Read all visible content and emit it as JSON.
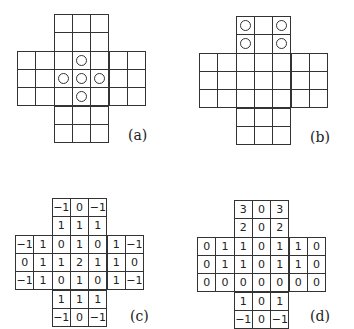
{
  "figure": {
    "panels": [
      {
        "id": "a",
        "label": "(a)",
        "type": "peg-board",
        "pegs": [
          [
            2,
            3
          ],
          [
            3,
            2
          ],
          [
            3,
            3
          ],
          [
            3,
            4
          ],
          [
            4,
            3
          ]
        ]
      },
      {
        "id": "b",
        "label": "(b)",
        "type": "peg-board",
        "pegs": [
          [
            0,
            2
          ],
          [
            0,
            4
          ],
          [
            1,
            2
          ],
          [
            1,
            4
          ]
        ]
      },
      {
        "id": "c",
        "label": "(c)",
        "type": "number-board",
        "rows": [
          [
            null,
            null,
            "-1",
            "0",
            "-1",
            null,
            null
          ],
          [
            null,
            null,
            "1",
            "1",
            "1",
            null,
            null
          ],
          [
            "-1",
            "1",
            "0",
            "1",
            "0",
            "1",
            "-1"
          ],
          [
            "0",
            "1",
            "1",
            "2",
            "1",
            "1",
            "0"
          ],
          [
            "-1",
            "1",
            "0",
            "1",
            "0",
            "1",
            "-1"
          ],
          [
            null,
            null,
            "1",
            "1",
            "1",
            null,
            null
          ],
          [
            null,
            null,
            "-1",
            "0",
            "-1",
            null,
            null
          ]
        ]
      },
      {
        "id": "d",
        "label": "(d)",
        "type": "number-board",
        "rows": [
          [
            null,
            null,
            "3",
            "0",
            "3",
            null,
            null
          ],
          [
            null,
            null,
            "2",
            "0",
            "2",
            null,
            null
          ],
          [
            "0",
            "1",
            "1",
            "0",
            "1",
            "1",
            "0"
          ],
          [
            "0",
            "1",
            "1",
            "0",
            "1",
            "1",
            "0"
          ],
          [
            "0",
            "0",
            "0",
            "0",
            "0",
            "0",
            "0"
          ],
          [
            null,
            null,
            "1",
            "0",
            "1",
            null,
            null
          ],
          [
            null,
            null,
            "-1",
            "0",
            "-1",
            null,
            null
          ]
        ]
      }
    ]
  },
  "layout": {
    "boards": [
      {
        "x": 17,
        "y": 14,
        "cell": 18.3
      },
      {
        "x": 199,
        "y": 16,
        "cell": 18.3
      },
      {
        "x": 15,
        "y": 198,
        "cell": 18.3
      },
      {
        "x": 197,
        "y": 200,
        "cell": 18.3
      }
    ],
    "labels": [
      {
        "x": 128,
        "y": 127
      },
      {
        "x": 310,
        "y": 129
      },
      {
        "x": 130,
        "y": 308
      },
      {
        "x": 310,
        "y": 308
      }
    ]
  }
}
